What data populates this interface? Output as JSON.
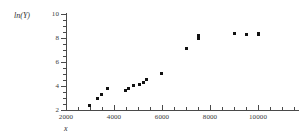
{
  "chart_data": {
    "type": "scatter",
    "title": "",
    "subtitle": "",
    "xlabel": "x",
    "ylabel": "ln(Y)",
    "xlim": [
      2000,
      11700
    ],
    "ylim": [
      2,
      10
    ],
    "x_ticks": [
      2000,
      4000,
      6000,
      8000,
      10000
    ],
    "x_tick_labels": [
      "2000",
      "4000",
      "6000",
      "8000",
      "10000"
    ],
    "x_minor_ticks": [
      2500,
      3000,
      3500,
      4500,
      5000,
      5500,
      6500,
      7000,
      7500,
      8500,
      9000,
      9500,
      10500,
      11000,
      11500
    ],
    "y_ticks": [
      2,
      4,
      6,
      8,
      10
    ],
    "y_tick_labels": [
      "2",
      "4",
      "6",
      "8",
      "10"
    ],
    "y_minor_ticks": [
      2.5,
      3,
      3.5,
      4.5,
      5,
      5.5,
      6.5,
      7,
      7.5,
      8.5,
      9,
      9.5
    ],
    "grid": false,
    "legend": null,
    "marker": "square",
    "marker_color": "#111111",
    "axis_color": "#4a4a4a",
    "background": "#ffffff",
    "points": [
      {
        "x": 2960,
        "y": 2.35
      },
      {
        "x": 3330,
        "y": 3.0
      },
      {
        "x": 3460,
        "y": 3.3
      },
      {
        "x": 3730,
        "y": 3.78
      },
      {
        "x": 4480,
        "y": 3.65
      },
      {
        "x": 4600,
        "y": 3.82
      },
      {
        "x": 4800,
        "y": 4.05
      },
      {
        "x": 5070,
        "y": 4.12
      },
      {
        "x": 5210,
        "y": 4.33
      },
      {
        "x": 5340,
        "y": 4.55
      },
      {
        "x": 5980,
        "y": 5.05
      },
      {
        "x": 7020,
        "y": 7.1
      },
      {
        "x": 7530,
        "y": 8.0
      },
      {
        "x": 7530,
        "y": 8.18
      },
      {
        "x": 9020,
        "y": 8.35
      },
      {
        "x": 9530,
        "y": 8.33
      },
      {
        "x": 10010,
        "y": 8.3
      },
      {
        "x": 10010,
        "y": 8.4
      }
    ]
  },
  "axes": {
    "y_title": "ln(Y)",
    "x_title": "x"
  }
}
